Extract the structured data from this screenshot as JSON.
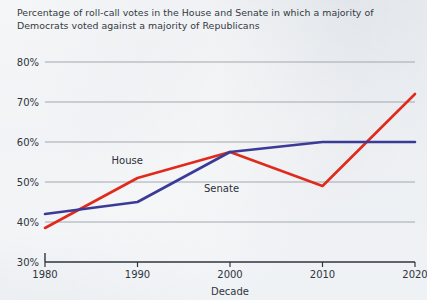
{
  "title": {
    "line1": "Percentage of roll-call votes in the House and Senate in which a majority of",
    "line2": "Democrats voted against a majority of Republicans"
  },
  "colors": {
    "house": "#e02b1c",
    "senate": "#3b3b97",
    "background": "#e3e7ec",
    "gridline": "#9aa0a8",
    "axis": "#2f353d",
    "text": "#333a42"
  },
  "chart_data": {
    "type": "line",
    "title": "Percentage of roll-call votes in the House and Senate in which a majority of Democrats voted against a majority of Republicans",
    "xlabel": "Decade",
    "ylabel": "",
    "x": [
      1980,
      1990,
      2000,
      2010,
      2020
    ],
    "xtick_labels": [
      "1980",
      "1990",
      "2000",
      "2010",
      "2020"
    ],
    "ytick_labels": [
      "30%",
      "40%",
      "50%",
      "60%",
      "70%",
      "80%"
    ],
    "ytick_values": [
      30,
      40,
      50,
      60,
      70,
      80
    ],
    "ylim": [
      30,
      80
    ],
    "xlim": [
      1980,
      2020
    ],
    "grid": true,
    "legend": "inline-labels",
    "series": [
      {
        "name": "House",
        "color": "#e02b1c",
        "values": [
          38.5,
          51.0,
          57.5,
          49.0,
          72.0
        ],
        "label_text": "House"
      },
      {
        "name": "Senate",
        "color": "#3b3b97",
        "values": [
          42.0,
          45.0,
          57.5,
          60.0,
          60.0
        ],
        "label_text": "Senate"
      }
    ],
    "annotations": [
      {
        "text": "House",
        "x": 1990,
        "y": 54.5
      },
      {
        "text": "Senate",
        "x": 2000,
        "y": 47.5
      }
    ]
  }
}
